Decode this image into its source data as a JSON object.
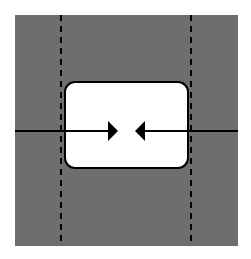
{
  "diagram": {
    "background_color": "#ffffff",
    "field": {
      "x": 15,
      "y": 15,
      "width": 223,
      "height": 231,
      "color": "#6e6e6e"
    },
    "guides": [
      {
        "name": "left-dashed-guide",
        "x": 61,
        "y1": 15,
        "y2": 246
      },
      {
        "name": "right-dashed-guide",
        "x": 191,
        "y1": 15,
        "y2": 246
      }
    ],
    "box": {
      "x": 65,
      "y": 82,
      "width": 123,
      "height": 86,
      "radius": 10,
      "fill": "#ffffff",
      "stroke": "#000000"
    },
    "axis_line": {
      "y": 131,
      "x1": 15,
      "x2": 238,
      "color": "#000000"
    },
    "arrows": [
      {
        "name": "right-pointing-arrow",
        "direction": "right",
        "tip_x": 118,
        "base_x": 108,
        "y": 131,
        "half_height": 10
      },
      {
        "name": "left-pointing-arrow",
        "direction": "left",
        "tip_x": 135,
        "base_x": 145,
        "y": 131,
        "half_height": 10
      }
    ]
  }
}
